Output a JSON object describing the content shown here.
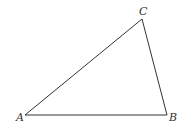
{
  "figure": {
    "type": "triangle",
    "stroke_color": "#333333",
    "vertices": [
      {
        "name": "A",
        "label": "A",
        "x": 25,
        "y": 115,
        "label_x": 16,
        "label_y": 121
      },
      {
        "name": "B",
        "label": "B",
        "x": 167,
        "y": 115,
        "label_x": 169,
        "label_y": 121
      },
      {
        "name": "C",
        "label": "C",
        "x": 142,
        "y": 19,
        "label_x": 139,
        "label_y": 15
      }
    ]
  }
}
